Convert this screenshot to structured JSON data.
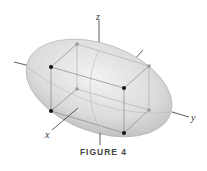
{
  "figure": {
    "caption": "FIGURE 4",
    "axes": {
      "x": "x",
      "y": "y",
      "z": "z"
    },
    "colors": {
      "ellipsoid_fill": "#d9d9d9",
      "box_edge": "#999999",
      "front_vertex": "#111111",
      "back_vertex": "#999999"
    }
  }
}
